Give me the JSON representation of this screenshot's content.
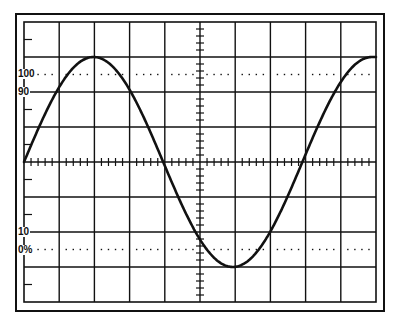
{
  "diagram": {
    "graticule": {
      "divisions_x": 10,
      "divisions_y": 8,
      "minor_ticks_per_division": 5,
      "line_color": "#111111",
      "background": "#ffffff"
    },
    "reference_lines": [
      {
        "label": "100",
        "type": "dotted",
        "level_percent": 100
      },
      {
        "label": "90",
        "type": "solid-gridline",
        "level_percent": 90
      },
      {
        "label": "10",
        "type": "solid-gridline",
        "level_percent": 10
      },
      {
        "label": "0%",
        "type": "dotted",
        "level_percent": 0
      }
    ],
    "labels": {
      "l100": "100",
      "l90": "90",
      "l10": "10",
      "l0": "0%"
    },
    "waveform": {
      "shape": "sine",
      "cycles_shown": 1.25,
      "start_phase": "zero-crossing rising",
      "peak_division": 3,
      "trough_division": -3,
      "color": "#111111"
    }
  }
}
